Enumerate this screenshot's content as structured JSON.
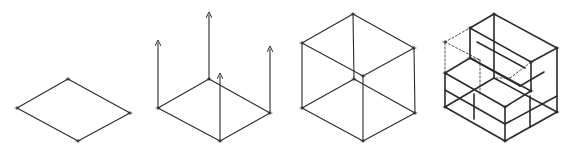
{
  "stroke_color": "#2b2b2b",
  "dash_color": "#3a3a3a",
  "background": "#ffffff",
  "figures": [
    {
      "id": "step-1-base-rhombus",
      "description": "Isometric base rhombus",
      "lines": [
        [
          68,
          79,
          17,
          108
        ],
        [
          17,
          108,
          78,
          141
        ],
        [
          78,
          141,
          130,
          113
        ],
        [
          130,
          113,
          68,
          79
        ]
      ],
      "dashed": [],
      "arrows": [],
      "vertices": [
        [
          68,
          79
        ],
        [
          17,
          108
        ],
        [
          78,
          141
        ],
        [
          130,
          113
        ]
      ]
    },
    {
      "id": "step-2-vertical-projections",
      "description": "Base rhombus with vertical arrows raised from each corner",
      "lines": [
        [
          209,
          79,
          158,
          108
        ],
        [
          158,
          108,
          220,
          141
        ],
        [
          220,
          141,
          270,
          113
        ],
        [
          270,
          113,
          209,
          79
        ]
      ],
      "dashed": [],
      "arrows": [
        [
          158,
          108,
          158,
          43
        ],
        [
          209,
          79,
          209,
          15
        ],
        [
          270,
          113,
          270,
          49
        ],
        [
          220,
          141,
          220,
          76
        ]
      ],
      "vertices": [
        [
          209,
          79
        ],
        [
          158,
          108
        ],
        [
          220,
          141
        ],
        [
          270,
          113
        ]
      ]
    },
    {
      "id": "step-3-wireframe-cube",
      "description": "Transparent wireframe cube",
      "lines": [
        [
          354,
          79,
          302,
          108
        ],
        [
          302,
          108,
          363,
          141
        ],
        [
          363,
          141,
          415,
          113
        ],
        [
          415,
          113,
          354,
          79
        ],
        [
          353,
          14,
          302,
          43
        ],
        [
          302,
          43,
          363,
          76
        ],
        [
          363,
          76,
          414,
          48
        ],
        [
          414,
          48,
          353,
          14
        ],
        [
          302,
          43,
          302,
          108
        ],
        [
          353,
          14,
          354,
          79
        ],
        [
          414,
          48,
          415,
          113
        ],
        [
          363,
          76,
          363,
          141
        ]
      ],
      "dashed": [],
      "arrows": [],
      "vertices": [
        [
          353,
          14
        ],
        [
          302,
          43
        ],
        [
          363,
          76
        ],
        [
          414,
          48
        ],
        [
          354,
          79
        ],
        [
          302,
          108
        ],
        [
          363,
          141
        ],
        [
          415,
          113
        ]
      ]
    },
    {
      "id": "step-4-l-shaped-solid",
      "description": "Subdivided box with removed corner block shown dashed",
      "lines": [
        [
          445,
          107,
          505,
          141
        ],
        [
          505,
          141,
          557,
          112
        ],
        [
          557,
          112,
          494,
          78
        ],
        [
          494,
          78,
          445,
          107
        ],
        [
          445,
          73,
          445,
          107
        ],
        [
          505,
          107,
          505,
          141
        ],
        [
          557,
          48,
          557,
          112
        ],
        [
          445,
          73,
          470,
          58
        ],
        [
          470,
          58,
          531,
          91
        ],
        [
          531,
          91,
          505,
          107
        ],
        [
          505,
          107,
          445,
          73
        ],
        [
          470,
          58,
          470,
          28
        ],
        [
          470,
          28,
          494,
          14
        ],
        [
          494,
          14,
          557,
          48
        ],
        [
          557,
          48,
          531,
          62
        ],
        [
          531,
          62,
          470,
          28
        ],
        [
          531,
          62,
          531,
          91
        ],
        [
          494,
          14,
          494,
          78
        ],
        [
          470,
          58,
          520,
          86
        ],
        [
          445,
          90,
          505,
          124
        ],
        [
          505,
          124,
          557,
          96
        ],
        [
          474,
          94,
          474,
          119
        ],
        [
          530,
          96,
          530,
          127
        ],
        [
          477,
          42,
          525,
          68
        ],
        [
          520,
          86,
          544,
          72
        ]
      ],
      "dashed": [
        [
          445,
          73,
          445,
          42
        ],
        [
          445,
          42,
          470,
          28
        ],
        [
          445,
          42,
          480,
          60
        ],
        [
          470,
          58,
          470,
          28
        ],
        [
          480,
          60,
          480,
          96
        ],
        [
          470,
          58,
          480,
          60
        ],
        [
          496,
          78,
          510,
          78
        ],
        [
          510,
          78,
          531,
          62
        ]
      ],
      "arrows": [],
      "vertices": [
        [
          494,
          14
        ],
        [
          470,
          28
        ],
        [
          445,
          42
        ],
        [
          557,
          48
        ],
        [
          470,
          58
        ],
        [
          531,
          62
        ],
        [
          445,
          73
        ],
        [
          531,
          91
        ],
        [
          505,
          107
        ],
        [
          445,
          107
        ],
        [
          557,
          112
        ],
        [
          505,
          141
        ]
      ]
    }
  ]
}
